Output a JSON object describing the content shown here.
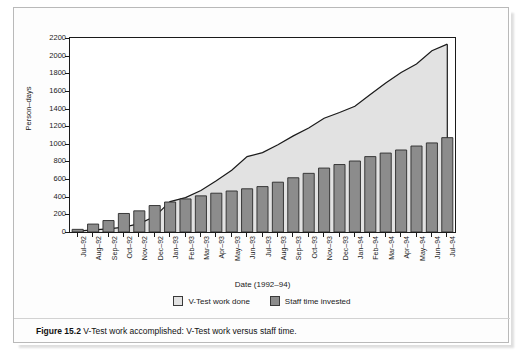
{
  "figure": {
    "caption_label": "Figure 15.2",
    "caption_text": "V-Test work accomplished: V-Test work versus staff time."
  },
  "colors": {
    "area_fill": "#e2e2e2",
    "area_line": "#1a1a1a",
    "bar_fill": "#8c8c8c",
    "bar_stroke": "#2a2a2a",
    "axis": "#1a1a1a",
    "page_background": "#ffffff"
  },
  "legend": {
    "position": "bottom-center",
    "items": [
      {
        "label": "V-Test work done",
        "swatch": "#e2e2e2"
      },
      {
        "label": "Staff time invested",
        "swatch": "#8c8c8c"
      }
    ]
  },
  "chart_data": {
    "type": "bar",
    "title": "",
    "subtitle": "",
    "xlabel": "Date (1992–94)",
    "ylabel": "Person–days",
    "ylim": [
      0,
      2200
    ],
    "ytick_step": 200,
    "yticks": [
      0,
      200,
      400,
      600,
      800,
      1000,
      1200,
      1400,
      1600,
      1800,
      2000,
      2200
    ],
    "grid": false,
    "categories": [
      "Jul–92",
      "Aug–92",
      "Sep–92",
      "Oct–92",
      "Nov–92",
      "Dec–92",
      "Jan–93",
      "Feb–93",
      "Mar–93",
      "Apr–93",
      "May–93",
      "Jun–93",
      "Jul–93",
      "Aug–93",
      "Sep–93",
      "Oct–93",
      "Nov–93",
      "Dec–93",
      "Jan–94",
      "Feb–94",
      "Mar–94",
      "Apr–94",
      "May–94",
      "Jun–94",
      "Jul–94"
    ],
    "series": [
      {
        "name": "V-Test work done",
        "render": "area",
        "values": [
          10,
          25,
          35,
          55,
          95,
          175,
          345,
          390,
          470,
          580,
          700,
          855,
          900,
          990,
          1090,
          1180,
          1290,
          1355,
          1425,
          1560,
          1690,
          1810,
          1905,
          2055,
          2130
        ]
      },
      {
        "name": "Staff time invested",
        "render": "bar",
        "values": [
          30,
          90,
          130,
          210,
          240,
          300,
          340,
          375,
          410,
          440,
          465,
          490,
          515,
          565,
          615,
          665,
          725,
          765,
          805,
          855,
          895,
          930,
          975,
          1010,
          1070
        ]
      }
    ]
  }
}
